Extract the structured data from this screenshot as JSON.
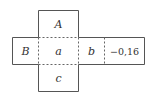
{
  "diagram": {
    "colors": {
      "line": "#555555",
      "text": "#333333",
      "background": "#ffffff"
    },
    "cells": {
      "top": {
        "label": "A"
      },
      "left": {
        "label": "B"
      },
      "center": {
        "label": "a"
      },
      "right": {
        "label": "b"
      },
      "far_right": {
        "label": "−0,16"
      },
      "bottom": {
        "label": "c"
      }
    }
  }
}
